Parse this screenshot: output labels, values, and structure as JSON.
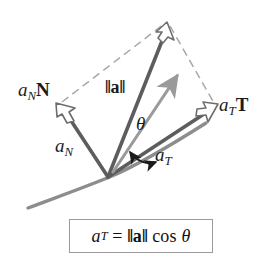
{
  "figure": {
    "background_color": "#ffffff",
    "width": 274,
    "height": 253
  },
  "colors": {
    "vector_dark": "#5a5a5a",
    "vector_outline": "#4a4a4a",
    "vector_light_gray": "#9a9a9a",
    "dashed_gray": "#a6a6a6",
    "curve_gray": "#8d8d8d",
    "text": "#1b1b1b",
    "box_border": "#9a9a9a"
  },
  "labels": {
    "a_n_vector": {
      "base": "a",
      "sub": "N",
      "vec": "N"
    },
    "norm_a": {
      "open": "‖",
      "bold": "a",
      "close": "‖"
    },
    "a_t_vector": {
      "base": "a",
      "sub": "T",
      "vec": "T"
    },
    "a_n_scalar": {
      "base": "a",
      "sub": "N"
    },
    "a_t_scalar": {
      "base": "a",
      "sub": "T"
    },
    "theta": "θ"
  },
  "formula": {
    "lhs_base": "a",
    "lhs_sub": "T",
    "equals": "=",
    "norm_open": "‖",
    "norm_bold": "a",
    "norm_close": "‖",
    "cos": "cos",
    "angle": "θ",
    "full_text": "a_T = ‖a‖ cos θ"
  },
  "geometry": {
    "origin": {
      "x": 108,
      "y": 177
    },
    "top_vertex": {
      "x": 166,
      "y": 23
    },
    "a_n_tip": {
      "x": 57,
      "y": 104
    },
    "a_t_tip": {
      "x": 216,
      "y": 108
    },
    "curve_start": {
      "x": 28,
      "y": 207
    },
    "curve_end": {
      "x": 205,
      "y": 125
    },
    "unit_tangent_tip": {
      "x": 178,
      "y": 74
    },
    "theta_arc_from": {
      "x": 133,
      "y": 152
    },
    "theta_arc_to": {
      "x": 155,
      "y": 160
    }
  }
}
